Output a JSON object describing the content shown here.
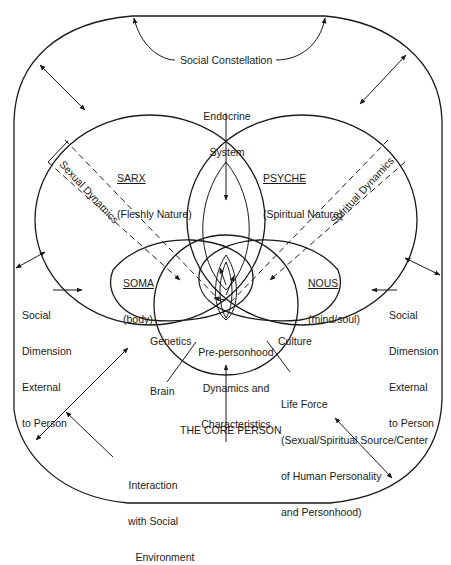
{
  "diagram": {
    "title": "The Core Person",
    "outer_frame": "Social Dimension External to Person",
    "labels": {
      "social_constellation": "Social Constellation",
      "endocrine_line1": "Endocrine",
      "endocrine_line2": "System",
      "sarx_title": "SARX",
      "sarx_sub": "(Fleshly Nature)",
      "psyche_title": "PSYCHE",
      "psyche_sub": "(Spiritual Nature)",
      "soma_title": "SOMA",
      "soma_sub": "(body)",
      "nous_title": "NOUS",
      "nous_sub": "(mind/soul)",
      "sexual_dynamics": "Sexual Dynamics",
      "spiritual_dynamics": "Spiritual Dynamics",
      "social_dim_left": [
        "Social",
        "Dimension",
        "External",
        "to Person"
      ],
      "social_dim_right": [
        "Social",
        "Dimension",
        "External",
        "to Person"
      ],
      "genetics": "Genetics",
      "culture": "Culture",
      "brain": "Brain",
      "prepersonhood": [
        "Pre-personhood",
        "Dynamics and",
        "Characteristics"
      ],
      "life_force": [
        "Life Force",
        "(Sexual/Spiritual Source/Center",
        "of Human Personality",
        "and Personhood)"
      ],
      "core_person": "THE CORE PERSON",
      "interaction": [
        "Interaction",
        "with Social",
        "Environment"
      ]
    },
    "colors": {
      "ink": "#1a1a1a",
      "background": "#ffffff"
    }
  }
}
